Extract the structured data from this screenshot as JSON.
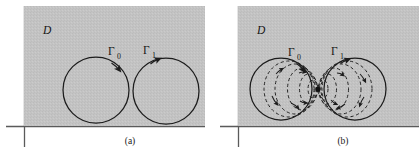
{
  "figure": {
    "title": "",
    "domain_label": "D",
    "panels": [
      {
        "id": "a",
        "caption": "(a)",
        "domain_label": "D",
        "contours": [
          {
            "label": "Γ",
            "subscript": "0",
            "name": "gamma-0",
            "orientation": "clockwise",
            "cx": 96,
            "cy": 90,
            "r": 33
          },
          {
            "label": "Γ",
            "subscript": "1",
            "name": "gamma-1",
            "orientation": "clockwise",
            "cx": 166,
            "cy": 91,
            "r": 33
          }
        ],
        "region": {
          "x": 24,
          "y": 6,
          "width": 181,
          "height": 120,
          "fill": "#c3c3c3"
        },
        "axes": {
          "h_y": 126,
          "h_x1": 6,
          "h_x2": 205,
          "v_x": 24,
          "v_y1": 6,
          "v_y2": 147
        }
      },
      {
        "id": "b",
        "caption": "(b)",
        "domain_label": "D",
        "contours": [
          {
            "label": "Γ",
            "subscript": "0",
            "name": "gamma-0",
            "orientation": "clockwise",
            "cx": 281,
            "cy": 89,
            "r": 31
          },
          {
            "label": "Γ",
            "subscript": "1",
            "name": "gamma-1",
            "orientation": "clockwise",
            "cx": 355,
            "cy": 89,
            "r": 31
          }
        ],
        "deformation": {
          "pinch_point_x": 318,
          "pinch_point_y": 89,
          "dashed_levels": 4
        },
        "region": {
          "x": 238,
          "y": 6,
          "width": 181,
          "height": 120,
          "fill": "#c3c3c3"
        },
        "axes": {
          "h_y": 126,
          "h_x1": 220,
          "h_x2": 419,
          "v_x": 238,
          "v_y1": 6,
          "v_y2": 147
        }
      }
    ],
    "colors": {
      "region_fill": "#c3c3c3",
      "stroke": "#1c1c1c",
      "background": "#ffffff"
    }
  }
}
